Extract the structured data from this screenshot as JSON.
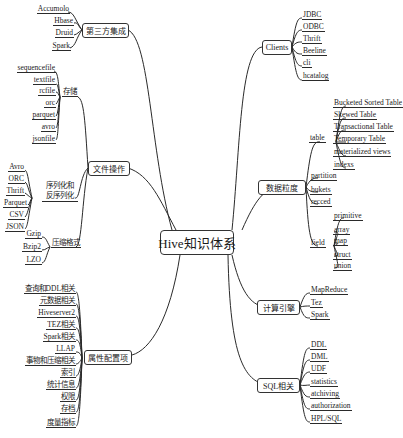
{
  "root": {
    "label": "Hive知识体系"
  },
  "branches": {
    "third_party": {
      "label": "第三方集成",
      "items": [
        "Accumolo",
        "Hbase",
        "Druid",
        "Spark"
      ]
    },
    "file_ops": {
      "label": "文件操作",
      "storage": {
        "label": "存储",
        "items": [
          "sequencefile",
          "textfile",
          "rcfile",
          "orc",
          "parquet",
          "avro",
          "jsonfile"
        ]
      },
      "serde": {
        "label_line1": "序列化和",
        "label_line2": "反序列化",
        "items": [
          "Avro",
          "ORC",
          "Thrift",
          "Parquet",
          "CSV",
          "JSON"
        ]
      },
      "compression": {
        "label": "压缩格式",
        "items": [
          "Gzip",
          "Bzip2",
          "LZO"
        ]
      }
    },
    "config": {
      "label": "属性配置项",
      "items": [
        "查询和DDL相关",
        "元数据相关",
        "Hiveserver2",
        "TEZ相关",
        "Spark相关",
        "LLAP",
        "事物和压缩相关",
        "索引",
        "统计信息",
        "权限",
        "存档",
        "度量指标"
      ]
    },
    "clients": {
      "label": "Clients",
      "items": [
        "JDBC",
        "ODBC",
        "Thrift",
        "Beeline",
        "cli",
        "hcatalog"
      ]
    },
    "granularity": {
      "label": "数据粒度",
      "table": {
        "label": "table",
        "items": [
          "Bucketed Sorted Table",
          "Skewed Table",
          "Transactional Table",
          "Temporary Table",
          "materialized views",
          "indexs"
        ]
      },
      "partition": {
        "label": "partition"
      },
      "bukets": {
        "label": "bukets"
      },
      "recced": {
        "label": "recced"
      },
      "field": {
        "label": "field",
        "items": [
          "primitive",
          "array",
          "map",
          "struct",
          "union"
        ]
      }
    },
    "engine": {
      "label": "计算引擎",
      "items": [
        "MapReduce",
        "Tez",
        "Spark"
      ]
    },
    "sql": {
      "label": "SQL相关",
      "items": [
        "DDL",
        "DML",
        "UDF",
        "statistics",
        "atchiving",
        "authorization",
        "HPL/SQL"
      ]
    }
  }
}
